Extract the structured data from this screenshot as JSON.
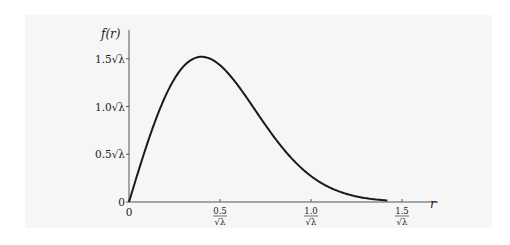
{
  "chart_data": {
    "type": "line",
    "title": "",
    "xlabel": "r",
    "ylabel": "f(r)",
    "function": "f(r) = 2πλ r exp(-πλ r²)",
    "x_unit": "1/√λ",
    "y_unit": "√λ",
    "xlim": [
      0,
      1.6
    ],
    "ylim": [
      0,
      1.7
    ],
    "grid": false,
    "legend": null,
    "x_ticks": [
      {
        "value": 0,
        "label": "0"
      },
      {
        "value": 0.5,
        "num": "0.5",
        "den": "√λ"
      },
      {
        "value": 1.0,
        "num": "1.0",
        "den": "√λ"
      },
      {
        "value": 1.5,
        "num": "1.5",
        "den": "√λ"
      }
    ],
    "y_ticks": [
      {
        "value": 0,
        "label": "0"
      },
      {
        "value": 0.5,
        "label": "0.5√λ"
      },
      {
        "value": 1.0,
        "label": "1.0√λ"
      },
      {
        "value": 1.5,
        "label": "1.5√λ"
      }
    ],
    "series": [
      {
        "name": "f(r)",
        "color": "#1a1a1a",
        "x": [
          0,
          0.1,
          0.2,
          0.3,
          0.4,
          0.5,
          0.6,
          0.7,
          0.8,
          0.9,
          1.0,
          1.1,
          1.2,
          1.3,
          1.4
        ],
        "y": [
          0,
          0.61,
          1.11,
          1.42,
          1.52,
          1.43,
          1.21,
          0.94,
          0.67,
          0.44,
          0.27,
          0.15,
          0.08,
          0.04,
          0.02
        ]
      }
    ],
    "peak": {
      "x": 0.399,
      "y": 1.52
    },
    "curve_end_x": 1.42
  },
  "labels": {
    "y_axis": "f(r)",
    "x_axis": "r",
    "origin_y": "0",
    "origin_x": "0"
  }
}
